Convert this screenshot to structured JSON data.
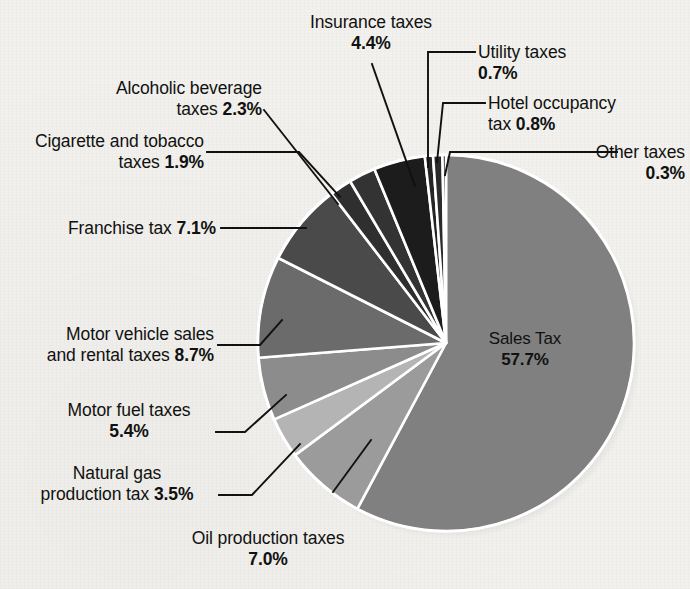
{
  "chart_data": {
    "type": "pie",
    "title": "",
    "subtitle": "",
    "xlabel": "",
    "ylabel": "",
    "legend_position": "callout-labels",
    "units": "percent",
    "categories": [
      "Sales Tax",
      "Oil production taxes",
      "Natural gas production tax",
      "Motor fuel taxes",
      "Motor vehicle sales and rental taxes",
      "Franchise tax",
      "Cigarette and tobacco taxes",
      "Alcoholic beverage taxes",
      "Insurance taxes",
      "Utility taxes",
      "Hotel occupancy tax",
      "Other taxes"
    ],
    "values": [
      57.7,
      7.0,
      3.5,
      5.4,
      8.7,
      7.1,
      1.9,
      2.3,
      4.4,
      0.7,
      0.8,
      0.3
    ],
    "colors": [
      "#808080",
      "#9b9b9b",
      "#b4b4b4",
      "#8c8c8c",
      "#6b6b6b",
      "#4a4a4a",
      "#2f2f2f",
      "#333333",
      "#1c1c1c",
      "#242424",
      "#2a2a2a",
      "#202020"
    ],
    "slice_separator_color": "#ffffff",
    "background_color": "#f2f1ed"
  },
  "slices": [
    {
      "name": "sales-tax",
      "label": "Sales Tax",
      "value": "57.7%"
    },
    {
      "name": "oil-production",
      "label": "Oil production taxes",
      "value": "7.0%"
    },
    {
      "name": "natural-gas",
      "label": "Natural gas",
      "value": "3.5%"
    },
    {
      "name": "motor-fuel",
      "label": "Motor fuel taxes",
      "value": "5.4%"
    },
    {
      "name": "motor-vehicle",
      "label": "Motor vehicle sales",
      "value": "8.7%"
    },
    {
      "name": "franchise",
      "label": "Franchise tax",
      "value": "7.1%"
    },
    {
      "name": "cigarette",
      "label": "Cigarette and tobacco",
      "value": "1.9%"
    },
    {
      "name": "alcoholic",
      "label": "Alcoholic beverage",
      "value": "2.3%"
    },
    {
      "name": "insurance",
      "label": "Insurance taxes",
      "value": "4.4%"
    },
    {
      "name": "utility",
      "label": "Utility taxes",
      "value": "0.7%"
    },
    {
      "name": "hotel",
      "label": "Hotel occupancy",
      "value": "0.8%"
    },
    {
      "name": "other",
      "label": "Other taxes",
      "value": "0.3%"
    }
  ],
  "callouts": {
    "insurance": {
      "line1": "Insurance taxes",
      "line2_pct": "4.4%"
    },
    "alcoholic": {
      "line1": "Alcoholic beverage",
      "line2_pre": "taxes ",
      "line2_pct": "2.3%"
    },
    "cigarette": {
      "line1": "Cigarette and tobacco",
      "line2_pre": "taxes ",
      "line2_pct": "1.9%"
    },
    "franchise": {
      "line1_pre": "Franchise tax ",
      "line1_pct": "7.1%"
    },
    "motor_vehicle": {
      "line1": "Motor vehicle sales",
      "line2_pre": "and rental taxes ",
      "line2_pct": "8.7%"
    },
    "motor_fuel": {
      "line1": "Motor fuel taxes",
      "line2_pct": "5.4%"
    },
    "natural_gas": {
      "line1": "Natural gas",
      "line2_pre": "production tax ",
      "line2_pct": "3.5%"
    },
    "oil": {
      "line1": "Oil production taxes",
      "line2_pct": "7.0%"
    },
    "utility": {
      "line1": "Utility taxes",
      "line2_pct": "0.7%"
    },
    "hotel": {
      "line1": "Hotel occupancy",
      "line2_pre": "tax ",
      "line2_pct": "0.8%"
    },
    "other": {
      "line1": "Other taxes",
      "line2_pct": "0.3%"
    },
    "sales": {
      "line1": "Sales Tax",
      "line2_pct": "57.7%"
    }
  }
}
